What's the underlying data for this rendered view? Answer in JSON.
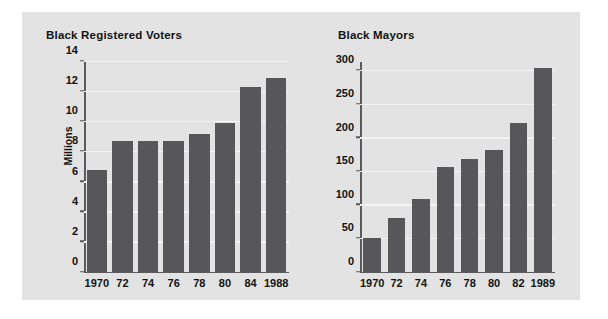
{
  "figure": {
    "background_color": "#ffffff",
    "panel_color": "#e3e3e3",
    "bar_color": "#57575a",
    "grid_color": "#f4f4f4",
    "axis_color": "#5a5a5c",
    "text_color": "#121212"
  },
  "chart_data": [
    {
      "type": "bar",
      "title": "Black Registered Voters",
      "xlabel": "",
      "ylabel": "Millions",
      "categories": [
        "1970",
        "72",
        "74",
        "76",
        "78",
        "80",
        "84",
        "1988"
      ],
      "values": [
        6.8,
        8.7,
        8.7,
        8.7,
        9.2,
        9.9,
        12.3,
        12.9
      ],
      "yticks": [
        0,
        2,
        4,
        6,
        8,
        10,
        12,
        14
      ],
      "ytick_labels": [
        "0",
        "2",
        "4",
        "6",
        "8",
        "10",
        "12",
        "14"
      ],
      "ylim": [
        0,
        14
      ],
      "grid": true,
      "legend": "none"
    },
    {
      "type": "bar",
      "title": "Black Mayors",
      "xlabel": "",
      "ylabel": "",
      "categories": [
        "1970",
        "72",
        "74",
        "76",
        "78",
        "80",
        "82",
        "1989"
      ],
      "values": [
        50,
        80,
        108,
        157,
        168,
        182,
        222,
        305
      ],
      "yticks": [
        0,
        50,
        100,
        150,
        200,
        250,
        300
      ],
      "ytick_labels": [
        "0",
        "50",
        "100",
        "150",
        "200",
        "250",
        "300"
      ],
      "ylim": [
        0,
        314
      ],
      "grid": true,
      "legend": "none"
    }
  ]
}
